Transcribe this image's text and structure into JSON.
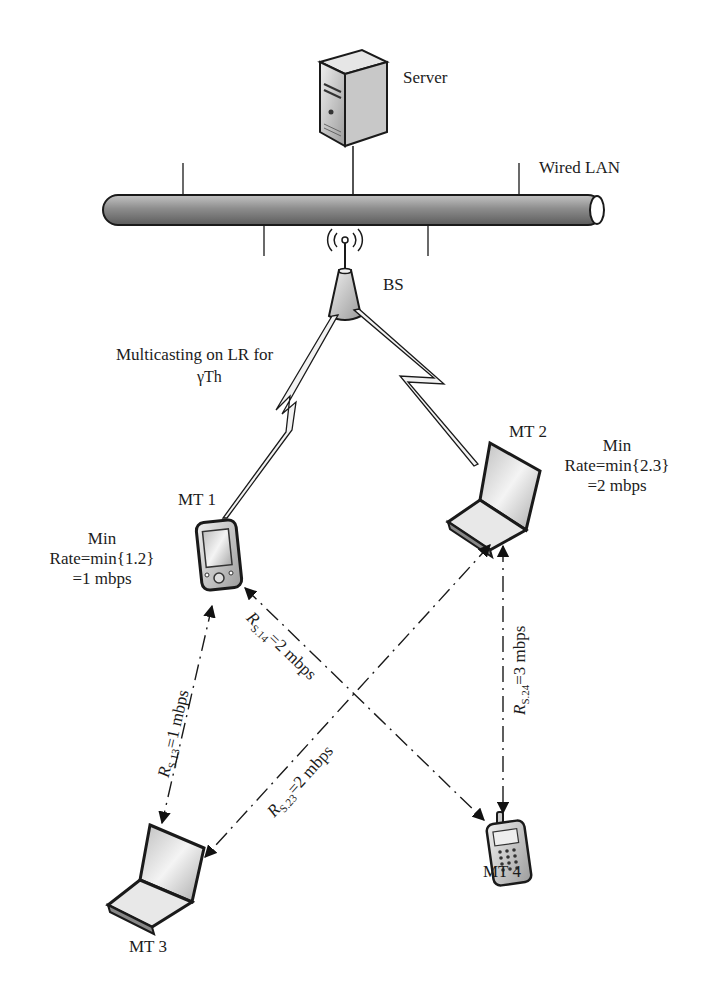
{
  "header": {
    "cut_off_caption": "Figure caption text (cut off at top edge)"
  },
  "nodes": {
    "server": {
      "label": "Server"
    },
    "lan": {
      "label": "Wired LAN"
    },
    "bs": {
      "label": "BS"
    },
    "mt1": {
      "label": "MT 1"
    },
    "mt2": {
      "label": "MT 2"
    },
    "mt3": {
      "label": "MT 3"
    },
    "mt4": {
      "label": "MT 4"
    }
  },
  "annotations": {
    "multicast_line1": "Multicasting on LR for",
    "multicast_line2": "γTh",
    "mt1_min_title": "Min",
    "mt1_min_rate": "Rate=min{1.2}",
    "mt1_min_value": "=1 mbps",
    "mt2_min_title": "Min",
    "mt2_min_rate": "Rate=min{2.3}",
    "mt2_min_value": "=2 mbps"
  },
  "links": [
    {
      "id": "rs13",
      "from": "MT 1",
      "to": "MT 3",
      "symbol": "R",
      "sub": "S.13",
      "rate": "=1 mbps"
    },
    {
      "id": "rs14",
      "from": "MT 1",
      "to": "MT 4",
      "symbol": "R",
      "sub": "S.14",
      "rate": "=2 mbps"
    },
    {
      "id": "rs23",
      "from": "MT 2",
      "to": "MT 3",
      "symbol": "R",
      "sub": "S.23",
      "rate": "=2 mbps"
    },
    {
      "id": "rs24",
      "from": "MT 2",
      "to": "MT 4",
      "symbol": "R",
      "sub": "S.24",
      "rate": "=3 mbps"
    }
  ],
  "wireless_links": [
    {
      "from": "BS",
      "to": "MT 1",
      "type": "lightning"
    },
    {
      "from": "BS",
      "to": "MT 2",
      "type": "lightning"
    }
  ],
  "colors": {
    "line": "#1a1a1a",
    "device_fill": "#d9d9d9",
    "tube": "#9a9a9a",
    "bolt_fill": "#f2f2f2"
  }
}
